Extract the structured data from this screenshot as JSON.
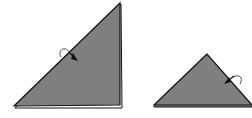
{
  "diagram": {
    "type": "origami-folding-steps",
    "steps": [
      {
        "id": "step-1",
        "shape": "right-triangle",
        "fill": "#7f7f7f",
        "stroke": "#111111",
        "points": [
          [
            121,
            3
          ],
          [
            14,
            107
          ],
          [
            121,
            107
          ]
        ],
        "layer_edge": "right-and-bottom",
        "arrow": {
          "kind": "fold-arrow",
          "position": [
            65,
            55
          ]
        }
      },
      {
        "id": "step-2",
        "shape": "isosceles-triangle",
        "fill": "#7f7f7f",
        "stroke": "#111111",
        "points": [
          [
            207,
            54
          ],
          [
            154,
            106
          ],
          [
            252,
            106
          ]
        ],
        "layer_edge": "bottom",
        "arrow": {
          "kind": "fold-arrow",
          "position": [
            228,
            76
          ]
        }
      }
    ]
  },
  "colors": {
    "paper_fill": "#7f7f7f",
    "outline": "#111111",
    "background": "#ffffff"
  }
}
